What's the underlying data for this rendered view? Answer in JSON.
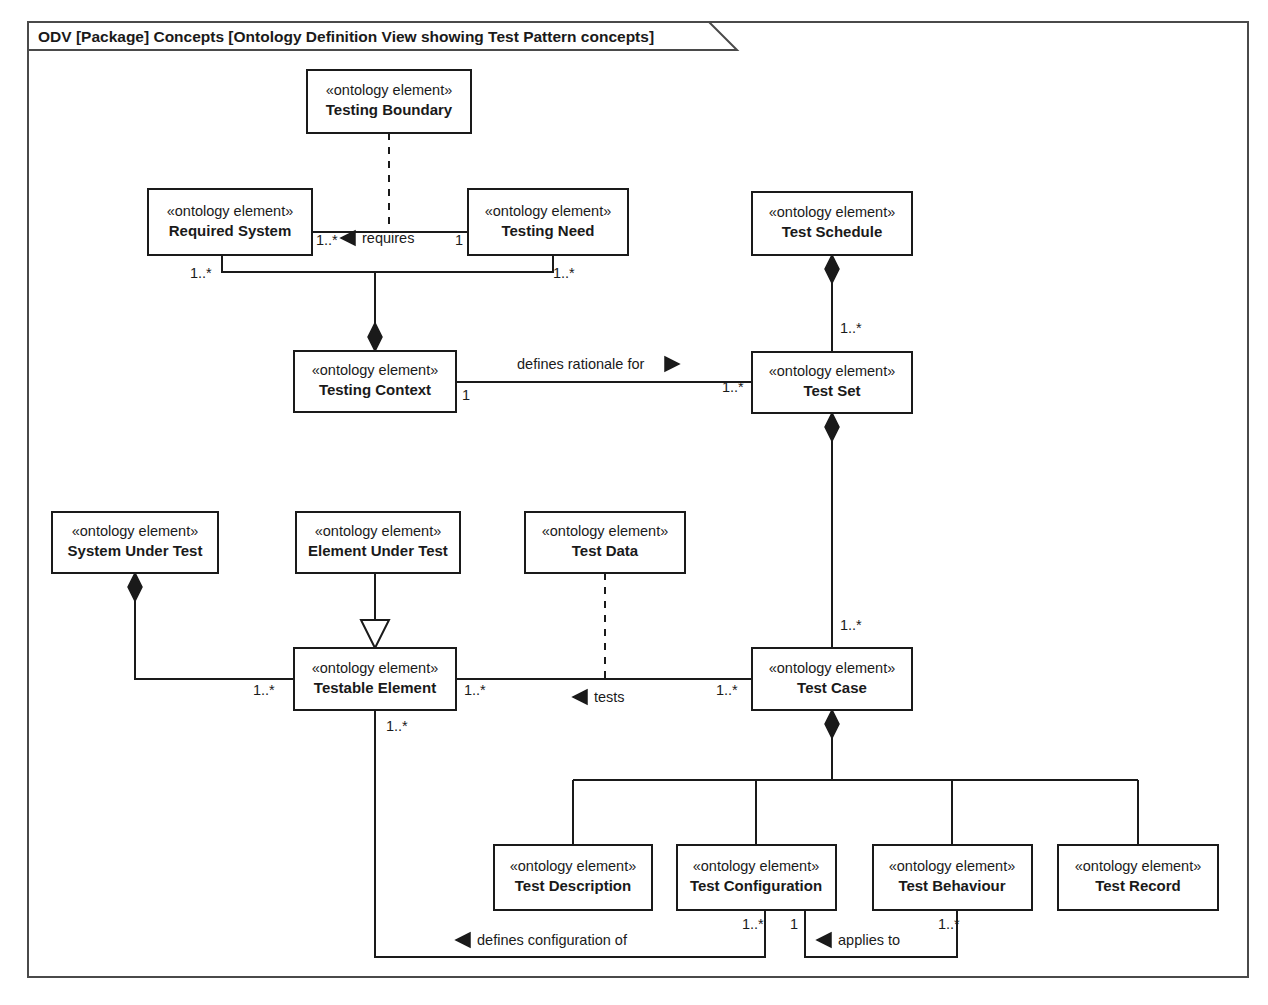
{
  "frame": {
    "title": "ODV [Package] Concepts [Ontology Definition View showing Test Pattern concepts]",
    "border_color": "#4a4a4a",
    "background": "#ffffff"
  },
  "stereotype": "«ontology element»",
  "nodes": [
    {
      "id": "testing-boundary",
      "name": "Testing Boundary",
      "stereotype": "«ontology element»",
      "x": 307,
      "y": 70,
      "w": 164,
      "h": 63
    },
    {
      "id": "required-system",
      "name": "Required System",
      "stereotype": "«ontology element»",
      "x": 148,
      "y": 189,
      "w": 164,
      "h": 66
    },
    {
      "id": "testing-need",
      "name": "Testing Need",
      "stereotype": "«ontology element»",
      "x": 468,
      "y": 189,
      "w": 160,
      "h": 66
    },
    {
      "id": "test-schedule",
      "name": "Test Schedule",
      "stereotype": "«ontology element»",
      "x": 752,
      "y": 192,
      "w": 160,
      "h": 63
    },
    {
      "id": "testing-context",
      "name": "Testing Context",
      "stereotype": "«ontology element»",
      "x": 294,
      "y": 351,
      "w": 162,
      "h": 61
    },
    {
      "id": "test-set",
      "name": "Test Set",
      "stereotype": "«ontology element»",
      "x": 752,
      "y": 352,
      "w": 160,
      "h": 61
    },
    {
      "id": "system-under-test",
      "name": "System Under Test",
      "stereotype": "«ontology element»",
      "x": 52,
      "y": 512,
      "w": 166,
      "h": 61
    },
    {
      "id": "element-under-test",
      "name": "Element Under Test",
      "stereotype": "«ontology element»",
      "x": 296,
      "y": 512,
      "w": 164,
      "h": 61
    },
    {
      "id": "test-data",
      "name": "Test Data",
      "stereotype": "«ontology element»",
      "x": 525,
      "y": 512,
      "w": 160,
      "h": 61
    },
    {
      "id": "testable-element",
      "name": "Testable Element",
      "stereotype": "«ontology element»",
      "x": 294,
      "y": 648,
      "w": 162,
      "h": 62
    },
    {
      "id": "test-case",
      "name": "Test Case",
      "stereotype": "«ontology element»",
      "x": 752,
      "y": 648,
      "w": 160,
      "h": 62
    },
    {
      "id": "test-description",
      "name": "Test Description",
      "stereotype": "«ontology element»",
      "x": 494,
      "y": 845,
      "w": 158,
      "h": 65
    },
    {
      "id": "test-configuration",
      "name": "Test Configuration",
      "stereotype": "«ontology element»",
      "x": 677,
      "y": 845,
      "w": 159,
      "h": 65
    },
    {
      "id": "test-behaviour",
      "name": "Test Behaviour",
      "stereotype": "«ontology element»",
      "x": 873,
      "y": 845,
      "w": 159,
      "h": 65
    },
    {
      "id": "test-record",
      "name": "Test Record",
      "stereotype": "«ontology element»",
      "x": 1058,
      "y": 845,
      "w": 160,
      "h": 65
    }
  ],
  "association_labels": [
    {
      "id": "requires",
      "text": "requires",
      "x": 362,
      "y": 243,
      "marker": "triangle-left",
      "marker_x": 348,
      "marker_y": 238
    },
    {
      "id": "defines-rationale-for",
      "text": "defines rationale for",
      "x": 517,
      "y": 369,
      "marker": "triangle-right",
      "marker_x": 665,
      "marker_y": 364
    },
    {
      "id": "tests",
      "text": "tests",
      "x": 594,
      "y": 702,
      "marker": "triangle-left",
      "marker_x": 580,
      "marker_y": 697
    },
    {
      "id": "defines-configuration-of",
      "text": "defines configuration of",
      "x": 477,
      "y": 945,
      "marker": "triangle-left",
      "marker_x": 463,
      "marker_y": 940
    },
    {
      "id": "applies-to",
      "text": "applies to",
      "x": 838,
      "y": 945,
      "marker": "triangle-left",
      "marker_x": 824,
      "marker_y": 940
    }
  ],
  "multiplicities": [
    {
      "id": "required-system-requires",
      "text": "1..*",
      "x": 316,
      "y": 245
    },
    {
      "id": "testing-need-requires",
      "text": "1",
      "x": 455,
      "y": 245
    },
    {
      "id": "required-system-context",
      "text": "1..*",
      "x": 190,
      "y": 278
    },
    {
      "id": "testing-need-context",
      "text": "1..*",
      "x": 553,
      "y": 278
    },
    {
      "id": "test-schedule-set",
      "text": "1..*",
      "x": 840,
      "y": 333
    },
    {
      "id": "testing-context-rationale",
      "text": "1",
      "x": 462,
      "y": 400
    },
    {
      "id": "test-set-rationale",
      "text": "1..*",
      "x": 724,
      "y": 392
    },
    {
      "id": "test-set-case",
      "text": "1..*",
      "x": 840,
      "y": 630
    },
    {
      "id": "testable-element-sut",
      "text": "1..*",
      "x": 255,
      "y": 695
    },
    {
      "id": "testable-element-tests",
      "text": "1..*",
      "x": 464,
      "y": 695
    },
    {
      "id": "test-case-tests",
      "text": "1..*",
      "x": 718,
      "y": 695
    },
    {
      "id": "testable-element-config",
      "text": "1..*",
      "x": 388,
      "y": 731
    },
    {
      "id": "test-configuration-defines",
      "text": "1..*",
      "x": 745,
      "y": 929
    },
    {
      "id": "test-configuration-applies",
      "text": "1",
      "x": 792,
      "y": 929
    },
    {
      "id": "test-behaviour-applies",
      "text": "1..*",
      "x": 940,
      "y": 929
    }
  ],
  "relationships": [
    {
      "id": "boundary-need-dependency",
      "type": "dependency",
      "from": "testing-boundary",
      "to": "requires-association"
    },
    {
      "id": "required-system-requires-testing-need",
      "type": "association",
      "from": "required-system",
      "to": "testing-need",
      "label": "requires"
    },
    {
      "id": "testing-context-composition",
      "type": "composition",
      "from": "testing-context",
      "to": "required-system-and-testing-need"
    },
    {
      "id": "testing-context-defines-rationale",
      "type": "association",
      "from": "testing-context",
      "to": "test-set",
      "label": "defines rationale for"
    },
    {
      "id": "test-schedule-aggregates-test-set",
      "type": "composition",
      "from": "test-schedule",
      "to": "test-set"
    },
    {
      "id": "test-set-aggregates-test-case",
      "type": "composition",
      "from": "test-set",
      "to": "test-case"
    },
    {
      "id": "system-under-test-aggregates-testable-element",
      "type": "composition",
      "from": "system-under-test",
      "to": "testable-element"
    },
    {
      "id": "element-under-test-generalizes-testable-element",
      "type": "generalization",
      "from": "element-under-test",
      "to": "testable-element"
    },
    {
      "id": "test-case-tests-testable-element",
      "type": "association",
      "from": "test-case",
      "to": "testable-element",
      "label": "tests"
    },
    {
      "id": "test-data-dependency",
      "type": "dependency",
      "from": "test-data",
      "to": "tests-association"
    },
    {
      "id": "test-case-aggregates-parts",
      "type": "composition",
      "from": "test-case",
      "to": "test-description-configuration-behaviour-record"
    },
    {
      "id": "test-configuration-defines-configuration-of",
      "type": "association",
      "from": "test-configuration",
      "to": "testable-element",
      "label": "defines configuration of"
    },
    {
      "id": "test-behaviour-applies-to",
      "type": "association",
      "from": "test-behaviour",
      "to": "test-configuration",
      "label": "applies to"
    }
  ]
}
